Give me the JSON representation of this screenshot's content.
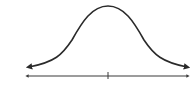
{
  "diagram": {
    "type": "normal-distribution-curve",
    "stroke_color": "#2a2a2a",
    "axis_color": "#3a3a3a",
    "background": "#ffffff",
    "labels": []
  }
}
